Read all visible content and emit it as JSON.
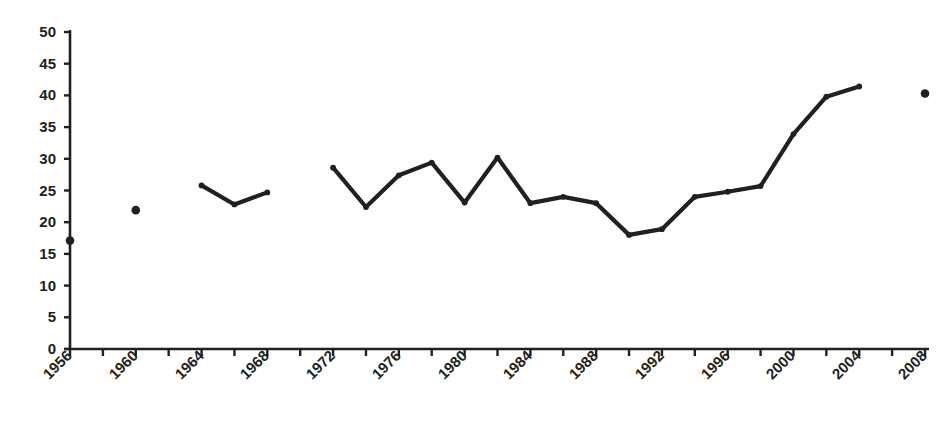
{
  "chart_data": {
    "type": "line",
    "title": "",
    "subtitle": "",
    "xlabel": "",
    "ylabel": "",
    "xlim": [
      1955,
      2009
    ],
    "ylim": [
      0,
      50
    ],
    "grid": false,
    "legend": false,
    "legend_position": "none",
    "marker": "filled-circle",
    "series_color": "#231f20",
    "y_ticks": [
      0,
      5,
      10,
      15,
      20,
      25,
      30,
      35,
      40,
      45,
      50
    ],
    "x_tick_labels": [
      "1956",
      "1960",
      "1964",
      "1968",
      "1972",
      "1976",
      "1980",
      "1984",
      "1988",
      "1992",
      "1996",
      "2000",
      "2004",
      "2008"
    ],
    "x_tick_label_years": [
      1956,
      1960,
      1964,
      1968,
      1972,
      1976,
      1980,
      1984,
      1988,
      1992,
      1996,
      2000,
      2004,
      2008
    ],
    "x_minor_tick_years": [
      1956,
      1958,
      1960,
      1962,
      1964,
      1966,
      1968,
      1970,
      1972,
      1974,
      1976,
      1978,
      1980,
      1982,
      1984,
      1986,
      1988,
      1990,
      1992,
      1994,
      1996,
      1998,
      2000,
      2002,
      2004,
      2006,
      2008
    ],
    "x": [
      1956,
      1960,
      1964,
      1966,
      1968,
      1972,
      1974,
      1976,
      1978,
      1980,
      1982,
      1984,
      1986,
      1988,
      1990,
      1992,
      1994,
      1996,
      1998,
      2000,
      2002,
      2004,
      2008
    ],
    "values": [
      17.1,
      21.9,
      25.8,
      22.8,
      24.7,
      28.6,
      22.4,
      27.4,
      29.4,
      23.1,
      30.2,
      23.0,
      24.0,
      23.0,
      18.0,
      18.9,
      24.0,
      24.8,
      25.7,
      33.9,
      39.8,
      41.4,
      40.3
    ],
    "segments": [
      {
        "name": "isolated-1956",
        "connected": false,
        "points": [
          {
            "x": 1956,
            "y": 17.1
          }
        ]
      },
      {
        "name": "isolated-1960",
        "connected": false,
        "points": [
          {
            "x": 1960,
            "y": 21.9
          }
        ]
      },
      {
        "name": "segment-1964-1968",
        "connected": true,
        "points": [
          {
            "x": 1964,
            "y": 25.8
          },
          {
            "x": 1966,
            "y": 22.8
          },
          {
            "x": 1968,
            "y": 24.7
          }
        ]
      },
      {
        "name": "segment-1972-2004",
        "connected": true,
        "points": [
          {
            "x": 1972,
            "y": 28.6
          },
          {
            "x": 1974,
            "y": 22.4
          },
          {
            "x": 1976,
            "y": 27.4
          },
          {
            "x": 1978,
            "y": 29.4
          },
          {
            "x": 1980,
            "y": 23.1
          },
          {
            "x": 1982,
            "y": 30.2
          },
          {
            "x": 1984,
            "y": 23.0
          },
          {
            "x": 1986,
            "y": 24.0
          },
          {
            "x": 1988,
            "y": 23.0
          },
          {
            "x": 1990,
            "y": 18.0
          },
          {
            "x": 1992,
            "y": 18.9
          },
          {
            "x": 1994,
            "y": 24.0
          },
          {
            "x": 1996,
            "y": 24.8
          },
          {
            "x": 1998,
            "y": 25.7
          },
          {
            "x": 2000,
            "y": 33.9
          },
          {
            "x": 2002,
            "y": 39.8
          },
          {
            "x": 2004,
            "y": 41.4
          }
        ]
      },
      {
        "name": "isolated-2008",
        "connected": false,
        "points": [
          {
            "x": 2008,
            "y": 40.3
          }
        ]
      }
    ]
  },
  "axes": {
    "axis_color": "#231f20",
    "y_axis_label_color": "#231f20",
    "x_axis_label_color": "#231f20"
  }
}
